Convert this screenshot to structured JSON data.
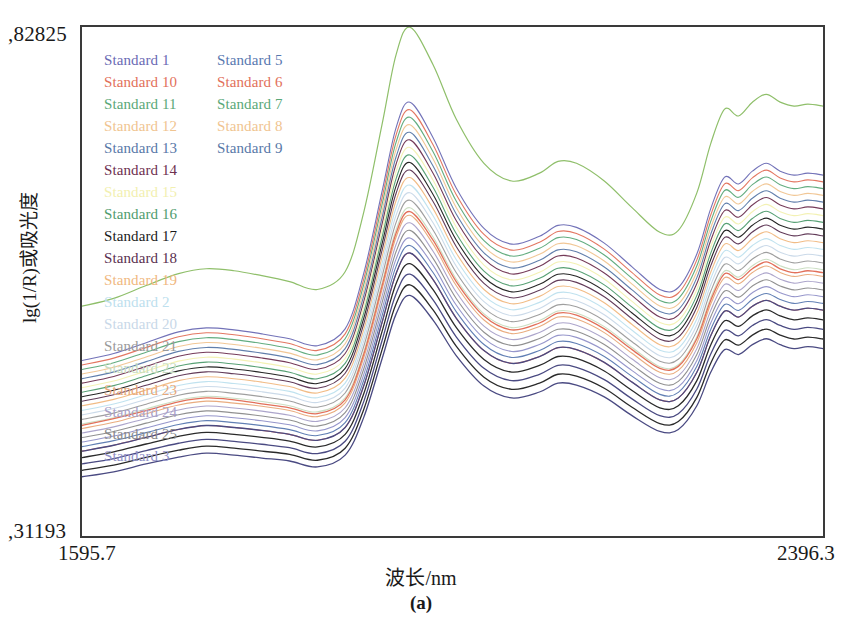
{
  "figure": {
    "caption": "(a)",
    "x_axis_title": "波长/nm",
    "y_axis_title": "lg(1/R)或吸光度",
    "y_max_label": ",82825",
    "y_min_label": ",31193",
    "x_min_label": "1595.7",
    "x_max_label": "2396.3"
  },
  "legend": {
    "column1": [
      {
        "label": "Standard 1",
        "color": "#6a6ab4"
      },
      {
        "label": "Standard 10",
        "color": "#e2705a"
      },
      {
        "label": "Standard 11",
        "color": "#5aa878"
      },
      {
        "label": "Standard 12",
        "color": "#f0c490"
      },
      {
        "label": "Standard 13",
        "color": "#5878a8"
      },
      {
        "label": "Standard 14",
        "color": "#6e3050"
      },
      {
        "label": "Standard 15",
        "color": "#f2f0b0"
      },
      {
        "label": "Standard 16",
        "color": "#4f9c6e"
      },
      {
        "label": "Standard 17",
        "color": "#1a1a1a"
      },
      {
        "label": "Standard 18",
        "color": "#5a3050"
      },
      {
        "label": "Standard 19",
        "color": "#f0b880"
      },
      {
        "label": "Standard 2",
        "color": "#bde0ee"
      },
      {
        "label": "Standard 20",
        "color": "#c8d8e8"
      },
      {
        "label": "Standard 21",
        "color": "#9a9a9a"
      },
      {
        "label": "Standard 22",
        "color": "#c8dcc0"
      },
      {
        "label": "Standard 23",
        "color": "#e8a878"
      },
      {
        "label": "Standard 24",
        "color": "#a8a0c8"
      },
      {
        "label": "Standard 25",
        "color": "#8a8a8a"
      },
      {
        "label": "Standard 3",
        "color": "#9090c8"
      }
    ],
    "column2": [
      {
        "label": "Standard 5",
        "color": "#5878b0"
      },
      {
        "label": "Standard 6",
        "color": "#e2705a"
      },
      {
        "label": "Standard 7",
        "color": "#5aa878"
      },
      {
        "label": "Standard 8",
        "color": "#f0c490"
      },
      {
        "label": "Standard 9",
        "color": "#5878a8"
      }
    ]
  },
  "chart_data": {
    "type": "line",
    "title": "",
    "subtitle": "",
    "xlabel": "波长/nm",
    "ylabel": "lg(1/R)或吸光度",
    "xlim": [
      1595.7,
      2396.3
    ],
    "ylim": [
      0.31193,
      0.82825
    ],
    "grid": false,
    "legend_position": "top-left-inside",
    "n_series": 28,
    "x": [
      1595.7,
      1630,
      1665,
      1700,
      1730,
      1760,
      1790,
      1820,
      1850,
      1880,
      1900,
      1920,
      1935,
      1950,
      1975,
      2000,
      2030,
      2060,
      2090,
      2110,
      2130,
      2160,
      2190,
      2220,
      2240,
      2260,
      2275,
      2290,
      2305,
      2320,
      2335,
      2350,
      2365,
      2380,
      2396.3
    ],
    "series": [
      {
        "name": "Standard 15 (upper outlier)",
        "color": "#8fbf6a",
        "values": [
          0.545,
          0.553,
          0.566,
          0.578,
          0.583,
          0.581,
          0.576,
          0.57,
          0.562,
          0.58,
          0.64,
          0.73,
          0.8,
          0.828,
          0.79,
          0.735,
          0.69,
          0.672,
          0.68,
          0.692,
          0.69,
          0.672,
          0.645,
          0.62,
          0.622,
          0.66,
          0.71,
          0.745,
          0.738,
          0.752,
          0.76,
          0.752,
          0.748,
          0.75,
          0.748
        ]
      },
      {
        "name": "Standard band upper (e.g. Standard 16)",
        "color": "#5aa878",
        "values": [
          0.49,
          0.497,
          0.508,
          0.519,
          0.523,
          0.521,
          0.517,
          0.512,
          0.505,
          0.522,
          0.578,
          0.662,
          0.726,
          0.752,
          0.716,
          0.665,
          0.624,
          0.608,
          0.616,
          0.627,
          0.625,
          0.609,
          0.585,
          0.562,
          0.564,
          0.598,
          0.644,
          0.676,
          0.669,
          0.682,
          0.69,
          0.682,
          0.678,
          0.68,
          0.678
        ]
      },
      {
        "name": "Standard band mid (e.g. Standard 14)",
        "color": "#6e3050",
        "values": [
          0.47,
          0.477,
          0.487,
          0.497,
          0.501,
          0.499,
          0.495,
          0.49,
          0.484,
          0.5,
          0.552,
          0.632,
          0.692,
          0.717,
          0.684,
          0.636,
          0.597,
          0.582,
          0.59,
          0.6,
          0.598,
          0.583,
          0.56,
          0.539,
          0.541,
          0.573,
          0.616,
          0.646,
          0.64,
          0.652,
          0.66,
          0.652,
          0.648,
          0.65,
          0.648
        ]
      },
      {
        "name": "Standard band mid (e.g. Standard 17)",
        "color": "#1a1a1a",
        "values": [
          0.452,
          0.459,
          0.468,
          0.478,
          0.482,
          0.48,
          0.476,
          0.471,
          0.465,
          0.48,
          0.53,
          0.606,
          0.663,
          0.687,
          0.656,
          0.61,
          0.573,
          0.558,
          0.566,
          0.576,
          0.574,
          0.559,
          0.537,
          0.517,
          0.519,
          0.549,
          0.59,
          0.619,
          0.613,
          0.625,
          0.632,
          0.625,
          0.621,
          0.623,
          0.621
        ]
      },
      {
        "name": "Standard band lower (e.g. Standard 10)",
        "color": "#e2705a",
        "values": [
          0.424,
          0.431,
          0.439,
          0.448,
          0.452,
          0.45,
          0.446,
          0.442,
          0.436,
          0.45,
          0.496,
          0.566,
          0.619,
          0.641,
          0.612,
          0.57,
          0.535,
          0.521,
          0.528,
          0.538,
          0.536,
          0.522,
          0.501,
          0.482,
          0.484,
          0.512,
          0.551,
          0.578,
          0.572,
          0.583,
          0.59,
          0.583,
          0.579,
          0.581,
          0.579
        ]
      },
      {
        "name": "Standard low group (e.g. Standard 18)",
        "color": "#3a3050",
        "values": [
          0.398,
          0.404,
          0.412,
          0.42,
          0.424,
          0.422,
          0.419,
          0.415,
          0.409,
          0.422,
          0.464,
          0.529,
          0.578,
          0.599,
          0.572,
          0.533,
          0.5,
          0.487,
          0.494,
          0.503,
          0.501,
          0.488,
          0.468,
          0.45,
          0.452,
          0.478,
          0.515,
          0.54,
          0.534,
          0.545,
          0.551,
          0.545,
          0.541,
          0.543,
          0.541
        ]
      },
      {
        "name": "Standard lowest (e.g. Standard 1)",
        "color": "#4a4a80",
        "values": [
          0.372,
          0.377,
          0.385,
          0.392,
          0.396,
          0.394,
          0.391,
          0.388,
          0.382,
          0.394,
          0.432,
          0.492,
          0.537,
          0.556,
          0.531,
          0.495,
          0.464,
          0.452,
          0.458,
          0.467,
          0.465,
          0.453,
          0.434,
          0.418,
          0.42,
          0.444,
          0.478,
          0.501,
          0.496,
          0.506,
          0.512,
          0.506,
          0.502,
          0.504,
          0.502
        ]
      }
    ],
    "features": [
      {
        "name": "water/OH combination peak",
        "x": 1950,
        "note": "largest absorbance maximum"
      },
      {
        "name": "secondary band",
        "x": 2110,
        "note": "broad shoulder maximum"
      },
      {
        "name": "CH combination ripples",
        "x": 2290,
        "note": "multi-ripple structure toward long wavelengths"
      },
      {
        "name": "local minimum",
        "x": 1850,
        "note": "valley before main peak"
      },
      {
        "name": "local minimum",
        "x": 2230,
        "note": "valley before ripple region"
      }
    ]
  }
}
